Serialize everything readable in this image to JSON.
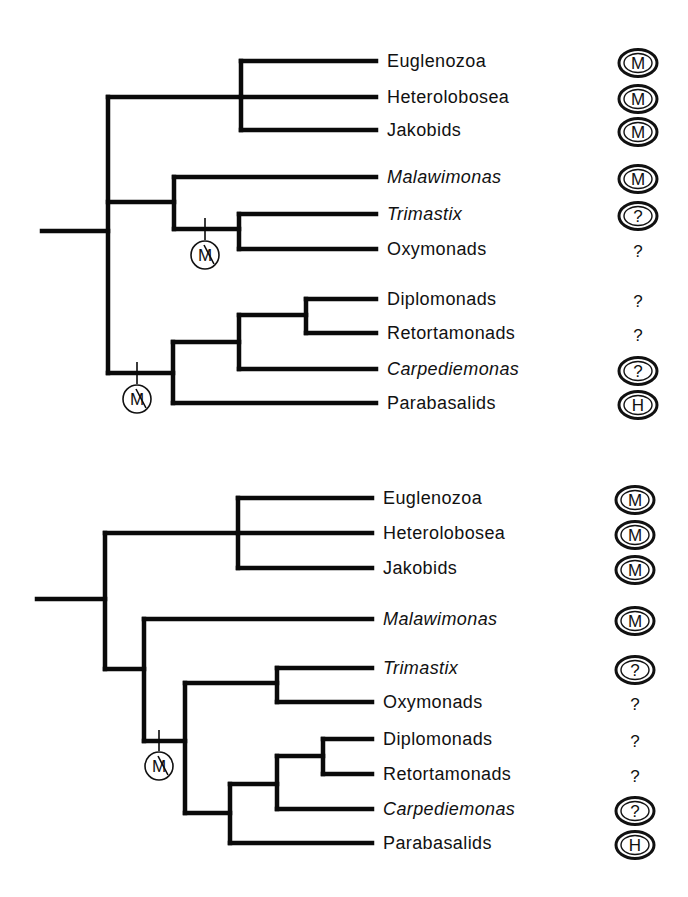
{
  "figure": {
    "legend_glyphs": {
      "M": "mitochondrion",
      "H": "hydrogenosome",
      "?": "unknown organelle",
      "M-struck": "loss of mitochondrion"
    }
  },
  "trees": [
    {
      "id": "tree-top",
      "branches": [
        [
          42,
          231,
          108,
          231
        ],
        [
          108,
          97,
          108,
          373
        ],
        [
          108,
          97,
          241,
          97
        ],
        [
          241,
          61,
          241,
          130
        ],
        [
          241,
          61,
          376,
          61
        ],
        [
          241,
          97,
          376,
          97
        ],
        [
          241,
          130,
          376,
          130
        ],
        [
          108,
          202,
          174,
          202
        ],
        [
          174,
          177,
          174,
          229
        ],
        [
          174,
          177,
          376,
          177
        ],
        [
          174,
          229,
          239,
          229
        ],
        [
          239,
          214,
          239,
          249
        ],
        [
          239,
          214,
          376,
          214
        ],
        [
          239,
          249,
          376,
          249
        ],
        [
          108,
          373,
          173,
          373
        ],
        [
          173,
          342,
          173,
          403
        ],
        [
          173,
          342,
          239,
          342
        ],
        [
          239,
          315,
          239,
          369
        ],
        [
          239,
          315,
          306,
          315
        ],
        [
          306,
          299,
          306,
          333
        ],
        [
          306,
          299,
          376,
          299
        ],
        [
          306,
          333,
          376,
          333
        ],
        [
          239,
          369,
          376,
          369
        ],
        [
          173,
          403,
          376,
          403
        ]
      ],
      "loss_markers": [
        {
          "x": 205,
          "tick_top": 218,
          "tick_bottom": 240,
          "cy": 255,
          "r": 14,
          "glyph": "M"
        },
        {
          "x": 137,
          "tick_top": 362,
          "tick_bottom": 384,
          "cy": 399,
          "r": 14,
          "glyph": "M"
        }
      ],
      "taxa": [
        {
          "name": "Euglenozoa",
          "italic": false,
          "y": 61,
          "status": "M",
          "status_style": "ellipse"
        },
        {
          "name": "Heterolobosea",
          "italic": false,
          "y": 97,
          "status": "M",
          "status_style": "ellipse"
        },
        {
          "name": "Jakobids",
          "italic": false,
          "y": 130,
          "status": "M",
          "status_style": "ellipse"
        },
        {
          "name": "Malawimonas",
          "italic": true,
          "y": 177,
          "status": "M",
          "status_style": "ellipse"
        },
        {
          "name": "Trimastix",
          "italic": true,
          "y": 214,
          "status": "?",
          "status_style": "ellipse"
        },
        {
          "name": "Oxymonads",
          "italic": false,
          "y": 249,
          "status": "?",
          "status_style": "plain"
        },
        {
          "name": "Diplomonads",
          "italic": false,
          "y": 299,
          "status": "?",
          "status_style": "plain"
        },
        {
          "name": "Retortamonads",
          "italic": false,
          "y": 333,
          "status": "?",
          "status_style": "plain"
        },
        {
          "name": "Carpediemonas",
          "italic": true,
          "y": 369,
          "status": "?",
          "status_style": "ellipse"
        },
        {
          "name": "Parabasalids",
          "italic": false,
          "y": 403,
          "status": "H",
          "status_style": "ellipse"
        }
      ],
      "label_x": 387,
      "icon_x": 638
    },
    {
      "id": "tree-bottom",
      "branches": [
        [
          37,
          599,
          105,
          599
        ],
        [
          105,
          533,
          105,
          669
        ],
        [
          105,
          533,
          238,
          533
        ],
        [
          238,
          498,
          238,
          568
        ],
        [
          238,
          498,
          372,
          498
        ],
        [
          238,
          533,
          372,
          533
        ],
        [
          238,
          568,
          372,
          568
        ],
        [
          105,
          669,
          144,
          669
        ],
        [
          144,
          619,
          144,
          741
        ],
        [
          144,
          619,
          372,
          619
        ],
        [
          144,
          741,
          185,
          741
        ],
        [
          185,
          683,
          185,
          813
        ],
        [
          185,
          683,
          277,
          683
        ],
        [
          277,
          668,
          277,
          702
        ],
        [
          277,
          668,
          372,
          668
        ],
        [
          277,
          702,
          372,
          702
        ],
        [
          185,
          813,
          230,
          813
        ],
        [
          230,
          784,
          230,
          843
        ],
        [
          230,
          784,
          277,
          784
        ],
        [
          277,
          756,
          277,
          809
        ],
        [
          277,
          756,
          323,
          756
        ],
        [
          323,
          739,
          323,
          774
        ],
        [
          323,
          739,
          372,
          739
        ],
        [
          323,
          774,
          372,
          774
        ],
        [
          277,
          809,
          372,
          809
        ],
        [
          230,
          843,
          372,
          843
        ]
      ],
      "loss_markers": [
        {
          "x": 159,
          "tick_top": 730,
          "tick_bottom": 751,
          "cy": 766,
          "r": 14,
          "glyph": "M"
        }
      ],
      "taxa": [
        {
          "name": "Euglenozoa",
          "italic": false,
          "y": 498,
          "status": "M",
          "status_style": "ellipse"
        },
        {
          "name": "Heterolobosea",
          "italic": false,
          "y": 533,
          "status": "M",
          "status_style": "ellipse"
        },
        {
          "name": "Jakobids",
          "italic": false,
          "y": 568,
          "status": "M",
          "status_style": "ellipse"
        },
        {
          "name": "Malawimonas",
          "italic": true,
          "y": 619,
          "status": "M",
          "status_style": "ellipse"
        },
        {
          "name": "Trimastix",
          "italic": true,
          "y": 668,
          "status": "?",
          "status_style": "ellipse"
        },
        {
          "name": "Oxymonads",
          "italic": false,
          "y": 702,
          "status": "?",
          "status_style": "plain"
        },
        {
          "name": "Diplomonads",
          "italic": false,
          "y": 739,
          "status": "?",
          "status_style": "plain"
        },
        {
          "name": "Retortamonads",
          "italic": false,
          "y": 774,
          "status": "?",
          "status_style": "plain"
        },
        {
          "name": "Carpediemonas",
          "italic": true,
          "y": 809,
          "status": "?",
          "status_style": "ellipse"
        },
        {
          "name": "Parabasalids",
          "italic": false,
          "y": 843,
          "status": "H",
          "status_style": "ellipse"
        }
      ],
      "label_x": 383,
      "icon_x": 635
    }
  ],
  "colors": {
    "ink": "#0a0a0a",
    "background": "#ffffff"
  }
}
